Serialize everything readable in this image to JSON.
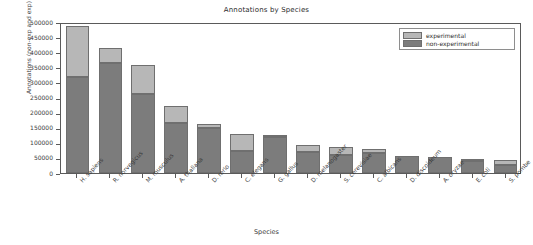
{
  "chart_data": {
    "type": "bar",
    "title": "Annotations by Species",
    "xlabel": "Species",
    "ylabel": "Annotations (non-exp and exp)",
    "ylim": [
      0,
      500000
    ],
    "ytick_labels": [
      "500000",
      "450000",
      "400000",
      "350000",
      "300000",
      "250000",
      "200000",
      "150000",
      "100000",
      "50000",
      "0"
    ],
    "ytick_values": [
      500000,
      450000,
      400000,
      350000,
      300000,
      250000,
      200000,
      150000,
      100000,
      50000,
      0
    ],
    "grid": false,
    "stacked": true,
    "legend_position": "upper right",
    "categories": [
      "H. sapiens",
      "R. norvegicus",
      "M. musculus",
      "A. thaliana",
      "D. rerio",
      "C. elegans",
      "G. gallus",
      "D. melanogaster",
      "S. cerevisiae",
      "C. albicans",
      "D. discoideum",
      "A. oryzae",
      "E. coli",
      "S. pombe"
    ],
    "series": [
      {
        "name": "non-experimental",
        "color": "#7c7c7c",
        "values": [
          317000,
          365000,
          263000,
          167000,
          150000,
          73000,
          120000,
          70000,
          60000,
          67000,
          57000,
          53000,
          40000,
          27000
        ]
      },
      {
        "name": "experimental",
        "color": "#b7b7b7",
        "values": [
          170000,
          50000,
          94000,
          56000,
          13000,
          57000,
          3000,
          23000,
          27000,
          13000,
          0,
          0,
          7000,
          16000
        ]
      }
    ],
    "totals": [
      487000,
      415000,
      357000,
      223000,
      163000,
      130000,
      123000,
      93000,
      87000,
      80000,
      57000,
      53000,
      47000,
      43000
    ]
  },
  "legend": {
    "entries": [
      {
        "label": "experimental"
      },
      {
        "label": "non-experimental"
      }
    ]
  }
}
